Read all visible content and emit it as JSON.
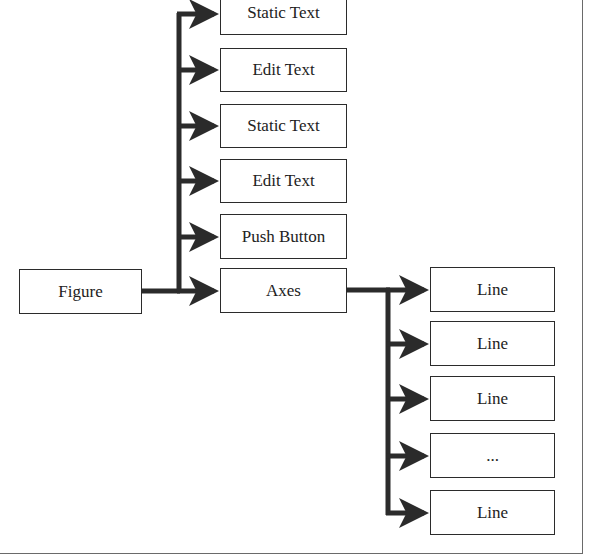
{
  "diagram": {
    "type": "hierarchy",
    "root": {
      "id": "figure",
      "label": "Figure"
    },
    "level1": [
      {
        "id": "static-text-1",
        "label": "Static Text"
      },
      {
        "id": "edit-text-1",
        "label": "Edit Text"
      },
      {
        "id": "static-text-2",
        "label": "Static Text"
      },
      {
        "id": "edit-text-2",
        "label": "Edit Text"
      },
      {
        "id": "push-button",
        "label": "Push Button"
      },
      {
        "id": "axes",
        "label": "Axes"
      }
    ],
    "level2": [
      {
        "id": "line-1",
        "label": "Line"
      },
      {
        "id": "line-2",
        "label": "Line"
      },
      {
        "id": "line-3",
        "label": "Line"
      },
      {
        "id": "ellipsis",
        "label": "..."
      },
      {
        "id": "line-4",
        "label": "Line"
      }
    ],
    "edges": [
      [
        "figure",
        "static-text-1"
      ],
      [
        "figure",
        "edit-text-1"
      ],
      [
        "figure",
        "static-text-2"
      ],
      [
        "figure",
        "edit-text-2"
      ],
      [
        "figure",
        "push-button"
      ],
      [
        "figure",
        "axes"
      ],
      [
        "axes",
        "line-1"
      ],
      [
        "axes",
        "line-2"
      ],
      [
        "axes",
        "line-3"
      ],
      [
        "axes",
        "ellipsis"
      ],
      [
        "axes",
        "line-4"
      ]
    ],
    "colors": {
      "line": "#2b2b2b",
      "border": "#6a6a6a",
      "background": "#ffffff"
    }
  }
}
